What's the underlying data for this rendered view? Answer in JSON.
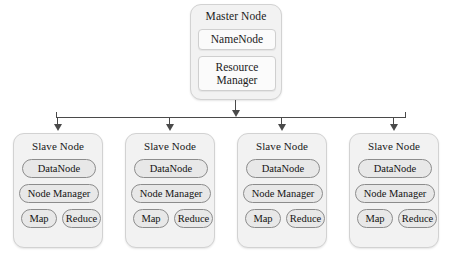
{
  "diagram": {
    "master": {
      "label": "Master Node",
      "components": [
        {
          "name": "namenode",
          "label": "NameNode"
        },
        {
          "name": "resource-manager",
          "label": "Resource Manager"
        }
      ]
    },
    "slaves": [
      {
        "label": "Slave Node",
        "datanode_label": "DataNode",
        "nodemanager_label": "Node Manager",
        "map_label": "Map",
        "reduce_label": "Reduce"
      },
      {
        "label": "Slave Node",
        "datanode_label": "DataNode",
        "nodemanager_label": "Node Manager",
        "map_label": "Map",
        "reduce_label": "Reduce"
      },
      {
        "label": "Slave Node",
        "datanode_label": "DataNode",
        "nodemanager_label": "Node Manager",
        "map_label": "Map",
        "reduce_label": "Reduce"
      },
      {
        "label": "Slave Node",
        "datanode_label": "DataNode",
        "nodemanager_label": "Node Manager",
        "map_label": "Map",
        "reduce_label": "Reduce"
      }
    ],
    "colors": {
      "card_fill": "#f2f2f2",
      "card_border": "#d2d2d2",
      "pill_fill": "#e8e8e8",
      "pill_border": "#8c8c8c",
      "sub_fill": "#fbfbfb",
      "connector": "#4a4a4a",
      "background": "#ffffff",
      "text": "#1a1a1a"
    }
  }
}
